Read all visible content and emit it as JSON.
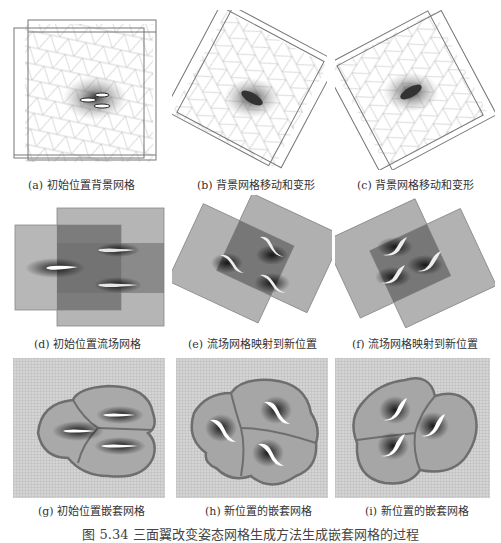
{
  "figure": {
    "panels": [
      {
        "id": "a",
        "caption": "(a) 初始位置背景网格"
      },
      {
        "id": "b",
        "caption": "(b) 背景网格移动和变形"
      },
      {
        "id": "c",
        "caption": "(c) 背景网格移动和变形"
      },
      {
        "id": "d",
        "caption": "(d) 初始位置流场网格"
      },
      {
        "id": "e",
        "caption": "(e) 流场网格映射到新位置"
      },
      {
        "id": "f",
        "caption": "(f) 流场网格映射到新位置"
      },
      {
        "id": "g",
        "caption": "(g) 初始位置嵌套网格"
      },
      {
        "id": "h",
        "caption": "(h) 新位置的嵌套网格"
      },
      {
        "id": "i",
        "caption": "(i) 新位置的嵌套网格"
      }
    ],
    "figure_caption": "图 5.34  三面翼改变姿态网格生成方法生成嵌套网格的过程"
  },
  "colors": {
    "background": "#ffffff",
    "mesh_line": "#9a9a9a",
    "block_light": "#b8b8b8",
    "block_dark": "#7a7a7a",
    "grid_fill": "#c9c9c9",
    "boundary": "#6e6e6e",
    "airfoil": "#ffffff"
  }
}
